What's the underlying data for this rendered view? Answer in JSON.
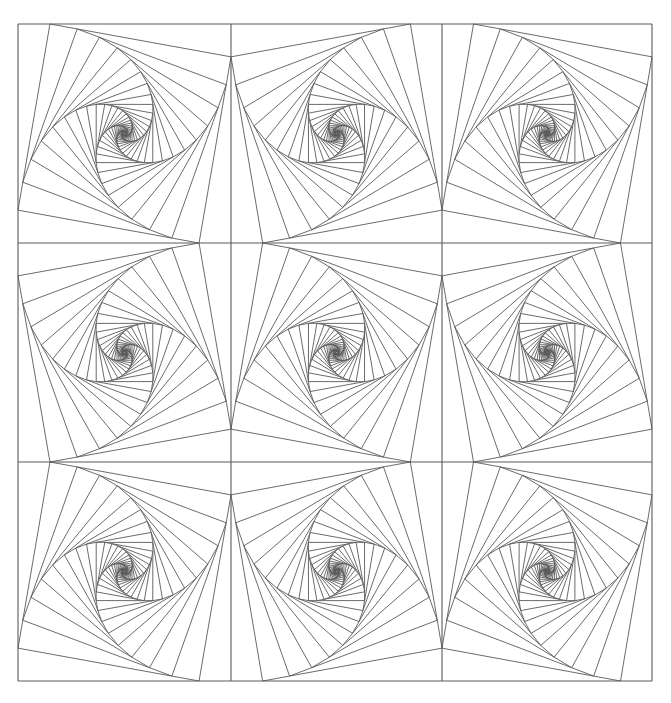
{
  "artwork": {
    "title": "Whirl spiral squares pattern",
    "canvas": {
      "width": 671,
      "height": 703,
      "background": "#ffffff"
    },
    "grid": {
      "x_lines": [
        18,
        231,
        442,
        652
      ],
      "y_lines": [
        24,
        243,
        462,
        681
      ],
      "rows": 3,
      "cols": 3
    },
    "stroke": {
      "color": "#5a5a5a",
      "width": 0.9
    },
    "spiral": {
      "fraction": 0.15,
      "iterations": 34
    },
    "cells": [
      [
        "A",
        "B",
        "A"
      ],
      [
        "B",
        "A",
        "B"
      ],
      [
        "A",
        "B",
        "A"
      ]
    ]
  }
}
